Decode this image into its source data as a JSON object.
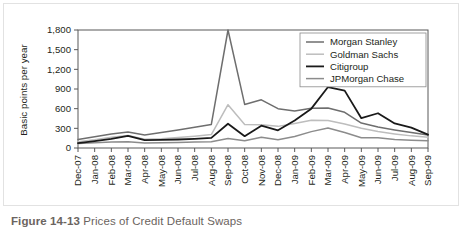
{
  "figure": {
    "caption_number": "Figure 14-13",
    "caption_title": "Prices of Credit Default Swaps"
  },
  "chart_data": {
    "type": "line",
    "title": "",
    "xlabel": "",
    "ylabel": "Basic points per year",
    "ylim": [
      0,
      1800
    ],
    "yticks": [
      0,
      300,
      600,
      900,
      1200,
      1500,
      1800
    ],
    "ytick_labels": [
      "0",
      "300",
      "600",
      "900",
      "1,200",
      "1,500",
      "1,800"
    ],
    "grid": false,
    "legend_position": "top-right",
    "x": [
      "Dec-07",
      "Jan-08",
      "Feb-08",
      "Mar-08",
      "Apr-08",
      "May-08",
      "Jun-08",
      "Jul-08",
      "Aug-08",
      "Sep-08",
      "Oct-08",
      "Nov-08",
      "Dec-08",
      "Jan-09",
      "Feb-09",
      "Mar-09",
      "Apr-09",
      "May-09",
      "Jun-09",
      "Jul-09",
      "Aug-09",
      "Sep-09"
    ],
    "series": [
      {
        "name": "Morgan Stanley",
        "color": "#6e6e6e",
        "width": 1.5,
        "values": [
          130,
          170,
          215,
          245,
          200,
          235,
          275,
          315,
          360,
          1800,
          665,
          735,
          600,
          565,
          605,
          610,
          545,
          380,
          320,
          275,
          235,
          200
        ]
      },
      {
        "name": "Goldman Sachs",
        "color": "#bdbdbd",
        "width": 1.5,
        "values": [
          95,
          125,
          165,
          190,
          135,
          140,
          160,
          180,
          205,
          660,
          360,
          355,
          330,
          375,
          425,
          420,
          365,
          300,
          250,
          215,
          185,
          165
        ]
      },
      {
        "name": "Citigroup",
        "color": "#1a1a1a",
        "width": 1.8,
        "values": [
          75,
          105,
          140,
          185,
          120,
          125,
          130,
          140,
          155,
          370,
          180,
          340,
          270,
          420,
          600,
          930,
          875,
          455,
          530,
          375,
          310,
          205
        ]
      },
      {
        "name": "JPMorgan Chase",
        "color": "#8c8c8c",
        "width": 1.5,
        "values": [
          70,
          80,
          90,
          95,
          75,
          80,
          85,
          90,
          95,
          145,
          110,
          165,
          125,
          175,
          250,
          305,
          235,
          155,
          155,
          130,
          120,
          110
        ]
      }
    ]
  }
}
